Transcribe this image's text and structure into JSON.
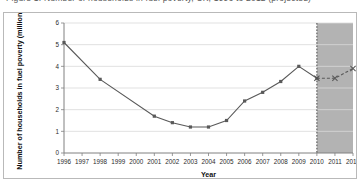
{
  "figure": {
    "cropped_title": "Figure 1: Number of households in fuel poverty, UK, 1996 to 2012 (projected)",
    "frame_border_color": "#b9b9b9"
  },
  "chart_data": {
    "type": "line",
    "title": "",
    "xlabel": "Year",
    "ylabel": "Number of households in fuel poverty (millions)",
    "xlim": [
      1996,
      2012
    ],
    "ylim": [
      0,
      6
    ],
    "yticks": [
      0,
      1,
      2,
      3,
      4,
      5,
      6
    ],
    "ytick_labels": [
      "0",
      "1",
      "2",
      "3",
      "4",
      "5",
      "6"
    ],
    "xticks": [
      1996,
      1997,
      1998,
      1999,
      2000,
      2001,
      2002,
      2003,
      2004,
      2005,
      2006,
      2007,
      2008,
      2009,
      2010,
      2011,
      2012
    ],
    "xtick_labels": [
      "1996",
      "1997",
      "1998",
      "1999",
      "2000",
      "2001",
      "2002",
      "2003",
      "2004",
      "2005",
      "2006",
      "2007",
      "2008",
      "2009",
      "2010",
      "2011",
      "2012"
    ],
    "grid": "horizontal",
    "grid_color": "#d9d9d9",
    "legend": "none",
    "series": [
      {
        "name": "Actual",
        "style": "solid",
        "color": "#595959",
        "marker": "square",
        "x": [
          1996,
          1997,
          1998,
          1999,
          2000,
          2001,
          2002,
          2003,
          2004,
          2005,
          2006,
          2007,
          2008,
          2009,
          2010
        ],
        "values": [
          5.1,
          null,
          3.4,
          null,
          null,
          1.7,
          1.4,
          1.2,
          1.2,
          1.5,
          2.4,
          2.8,
          3.3,
          4.0,
          3.45
        ],
        "marker_years": [
          1996,
          1998,
          2001,
          2002,
          2003,
          2004,
          2005,
          2006,
          2007,
          2008,
          2009,
          2010
        ]
      },
      {
        "name": "Projected",
        "style": "dashed",
        "color": "#595959",
        "marker": "x",
        "x": [
          2010,
          2011,
          2012
        ],
        "values": [
          3.45,
          3.45,
          3.9
        ]
      }
    ],
    "annotations": [
      {
        "type": "shaded-band",
        "label": "projection-band",
        "x_start": 2010,
        "x_end": 2012,
        "color": "#b3b3b3"
      },
      {
        "type": "vertical-divider",
        "label": "projection-divider",
        "x": 2010,
        "style": "dotted",
        "color": "#4a4a4a"
      }
    ]
  }
}
